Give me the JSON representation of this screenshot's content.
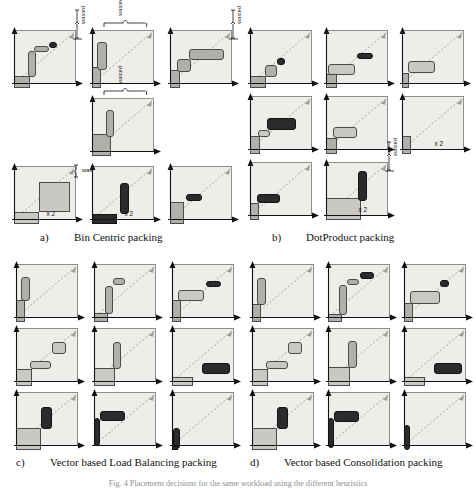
{
  "figure": {
    "caption": "Fig. 4 Placement decisions for the same workload using the different heuristics",
    "wasted_label": "wasted",
    "multiplier_label": "x 2"
  },
  "sections": [
    {
      "tag": "a)",
      "title": "Bin Centric packing"
    },
    {
      "tag": "b)",
      "title": "DotProduct packing"
    },
    {
      "tag": "c)",
      "title": "Vector based Load Balancing packing"
    },
    {
      "tag": "d)",
      "title": "Vector based Consolidation packing"
    }
  ],
  "colors": {
    "bin_fill": "#eeedea",
    "bin_border": "#8d8d8a",
    "item_light": "#c9c8c4",
    "item_mid": "#b0afab",
    "item_dark": "#2b2b2b",
    "item_pale": "#d8d7d3",
    "diagonal": "#9a9a97",
    "axis": "#111111"
  },
  "chart_data": {
    "type": "diagram",
    "title": "Placement decisions for the same workload using the different heuristics",
    "panels": [
      {
        "tag": "a)",
        "title": "Bin Centric packing",
        "bins": [
          {
            "row": 0,
            "col": 0,
            "wasted_brace": "vertical-right",
            "items": [
              {
                "x": 0.0,
                "y": 0.0,
                "w": 0.26,
                "h": 0.22,
                "shade": "mid",
                "square": true
              },
              {
                "x": 0.22,
                "y": 0.2,
                "w": 0.14,
                "h": 0.48,
                "shade": "mid"
              },
              {
                "x": 0.33,
                "y": 0.66,
                "w": 0.24,
                "h": 0.12,
                "shade": "mid"
              },
              {
                "x": 0.57,
                "y": 0.74,
                "w": 0.12,
                "h": 0.12,
                "shade": "dark"
              }
            ]
          },
          {
            "row": 0,
            "col": 1,
            "wasted_brace": "horizontal-top",
            "items": [
              {
                "x": 0.0,
                "y": 0.0,
                "w": 0.14,
                "h": 0.38,
                "shade": "mid",
                "square": true
              },
              {
                "x": 0.08,
                "y": 0.33,
                "w": 0.16,
                "h": 0.52,
                "shade": "mid"
              }
            ]
          },
          {
            "row": 0,
            "col": 2,
            "wasted_brace": "vertical-right",
            "items": [
              {
                "x": 0.0,
                "y": 0.0,
                "w": 0.16,
                "h": 0.34,
                "shade": "mid",
                "square": true
              },
              {
                "x": 0.12,
                "y": 0.3,
                "w": 0.22,
                "h": 0.24,
                "shade": "mid"
              },
              {
                "x": 0.31,
                "y": 0.52,
                "w": 0.56,
                "h": 0.2,
                "shade": "mid"
              }
            ]
          },
          {
            "row": 1,
            "col": 1,
            "wasted_brace": "horizontal-top",
            "items": [
              {
                "x": 0.0,
                "y": 0.0,
                "w": 0.3,
                "h": 0.4,
                "shade": "mid",
                "square": true
              },
              {
                "x": 0.22,
                "y": 0.36,
                "w": 0.14,
                "h": 0.5,
                "shade": "mid"
              }
            ]
          },
          {
            "row": 2,
            "col": 0,
            "wasted_brace": "vertical-right-small",
            "wasted_text": true,
            "multiplier": "x 2",
            "items": [
              {
                "x": 0.0,
                "y": 0.0,
                "w": 0.4,
                "h": 0.22,
                "shade": "light",
                "square": true
              },
              {
                "x": 0.4,
                "y": 0.22,
                "w": 0.5,
                "h": 0.56,
                "shade": "light",
                "square": true
              }
            ]
          },
          {
            "row": 2,
            "col": 1,
            "multiplier": "x 2",
            "items": [
              {
                "x": 0.0,
                "y": 0.0,
                "w": 0.4,
                "h": 0.18,
                "shade": "dark",
                "square": true
              },
              {
                "x": 0.45,
                "y": 0.18,
                "w": 0.14,
                "h": 0.58,
                "shade": "dark"
              }
            ]
          },
          {
            "row": 2,
            "col": 2,
            "items": [
              {
                "x": 0.0,
                "y": 0.0,
                "w": 0.22,
                "h": 0.4,
                "shade": "mid",
                "square": true
              },
              {
                "x": 0.26,
                "y": 0.42,
                "w": 0.26,
                "h": 0.13,
                "shade": "dark"
              }
            ]
          }
        ]
      },
      {
        "tag": "b)",
        "title": "DotProduct packing",
        "bins": [
          {
            "row": 0,
            "col": 0,
            "items": [
              {
                "x": 0.0,
                "y": 0.0,
                "w": 0.26,
                "h": 0.22,
                "shade": "mid",
                "square": true
              },
              {
                "x": 0.24,
                "y": 0.21,
                "w": 0.2,
                "h": 0.22,
                "shade": "mid"
              },
              {
                "x": 0.44,
                "y": 0.42,
                "w": 0.12,
                "h": 0.13,
                "shade": "dark"
              }
            ]
          },
          {
            "row": 0,
            "col": 1,
            "items": [
              {
                "x": 0.0,
                "y": 0.0,
                "w": 0.18,
                "h": 0.26,
                "shade": "mid",
                "square": true
              },
              {
                "x": 0.03,
                "y": 0.25,
                "w": 0.44,
                "h": 0.2,
                "shade": "light"
              },
              {
                "x": 0.5,
                "y": 0.53,
                "w": 0.26,
                "h": 0.11,
                "shade": "dark"
              }
            ]
          },
          {
            "row": 0,
            "col": 2,
            "items": [
              {
                "x": 0.0,
                "y": 0.0,
                "w": 0.12,
                "h": 0.28,
                "shade": "mid",
                "square": true
              },
              {
                "x": 0.1,
                "y": 0.28,
                "w": 0.44,
                "h": 0.22,
                "shade": "light"
              }
            ]
          },
          {
            "row": 1,
            "col": 0,
            "items": [
              {
                "x": 0.0,
                "y": 0.0,
                "w": 0.16,
                "h": 0.34,
                "shade": "mid",
                "square": true
              },
              {
                "x": 0.13,
                "y": 0.32,
                "w": 0.2,
                "h": 0.13,
                "shade": "light"
              },
              {
                "x": 0.28,
                "y": 0.44,
                "w": 0.46,
                "h": 0.22,
                "shade": "dark"
              }
            ]
          },
          {
            "row": 1,
            "col": 1,
            "items": [
              {
                "x": 0.0,
                "y": 0.0,
                "w": 0.18,
                "h": 0.3,
                "shade": "mid",
                "square": true
              },
              {
                "x": 0.12,
                "y": 0.3,
                "w": 0.38,
                "h": 0.2,
                "shade": "light"
              }
            ]
          },
          {
            "row": 1,
            "col": 2,
            "multiplier": "x 2",
            "items": [
              {
                "x": 0.0,
                "y": 0.0,
                "w": 0.14,
                "h": 0.34,
                "shade": "mid",
                "square": true
              }
            ]
          },
          {
            "row": 2,
            "col": 0,
            "items": [
              {
                "x": 0.0,
                "y": 0.0,
                "w": 0.14,
                "h": 0.32,
                "shade": "mid",
                "square": true
              },
              {
                "x": 0.12,
                "y": 0.32,
                "w": 0.36,
                "h": 0.17,
                "shade": "dark"
              }
            ]
          },
          {
            "row": 2,
            "col": 1,
            "wasted_brace": "vertical-right",
            "multiplier": "x 2",
            "items": [
              {
                "x": 0.0,
                "y": 0.0,
                "w": 0.56,
                "h": 0.4,
                "shade": "light",
                "square": true
              },
              {
                "x": 0.52,
                "y": 0.36,
                "w": 0.14,
                "h": 0.55,
                "shade": "dark"
              }
            ]
          }
        ]
      },
      {
        "tag": "c)",
        "title": "Vector based Load Balancing packing",
        "bins": [
          {
            "row": 0,
            "col": 0,
            "items": [
              {
                "x": 0.0,
                "y": 0.0,
                "w": 0.14,
                "h": 0.4,
                "shade": "mid",
                "square": true
              },
              {
                "x": 0.08,
                "y": 0.38,
                "w": 0.14,
                "h": 0.46,
                "shade": "mid"
              }
            ]
          },
          {
            "row": 0,
            "col": 1,
            "items": [
              {
                "x": 0.0,
                "y": 0.0,
                "w": 0.22,
                "h": 0.16,
                "shade": "mid",
                "square": true
              },
              {
                "x": 0.17,
                "y": 0.14,
                "w": 0.14,
                "h": 0.52,
                "shade": "mid"
              },
              {
                "x": 0.3,
                "y": 0.68,
                "w": 0.2,
                "h": 0.13,
                "shade": "mid"
              }
            ]
          },
          {
            "row": 0,
            "col": 2,
            "items": [
              {
                "x": 0.0,
                "y": 0.0,
                "w": 0.14,
                "h": 0.4,
                "shade": "mid",
                "square": true
              },
              {
                "x": 0.1,
                "y": 0.38,
                "w": 0.42,
                "h": 0.22,
                "shade": "light"
              },
              {
                "x": 0.55,
                "y": 0.64,
                "w": 0.24,
                "h": 0.12,
                "shade": "dark"
              }
            ]
          },
          {
            "row": 1,
            "col": 0,
            "items": [
              {
                "x": 0.0,
                "y": 0.0,
                "w": 0.26,
                "h": 0.32,
                "shade": "light",
                "square": true
              },
              {
                "x": 0.22,
                "y": 0.31,
                "w": 0.34,
                "h": 0.16,
                "shade": "light"
              },
              {
                "x": 0.58,
                "y": 0.6,
                "w": 0.22,
                "h": 0.22,
                "shade": "light"
              }
            ]
          },
          {
            "row": 1,
            "col": 1,
            "items": [
              {
                "x": 0.0,
                "y": 0.0,
                "w": 0.34,
                "h": 0.34,
                "shade": "light",
                "square": true
              },
              {
                "x": 0.3,
                "y": 0.32,
                "w": 0.14,
                "h": 0.5,
                "shade": "mid"
              }
            ]
          },
          {
            "row": 1,
            "col": 2,
            "items": [
              {
                "x": 0.0,
                "y": 0.0,
                "w": 0.34,
                "h": 0.16,
                "shade": "light",
                "square": true
              },
              {
                "x": 0.48,
                "y": 0.22,
                "w": 0.46,
                "h": 0.2,
                "shade": "dark"
              }
            ]
          },
          {
            "row": 2,
            "col": 0,
            "items": [
              {
                "x": 0.0,
                "y": 0.0,
                "w": 0.4,
                "h": 0.4,
                "shade": "light",
                "square": true
              },
              {
                "x": 0.4,
                "y": 0.38,
                "w": 0.18,
                "h": 0.42,
                "shade": "dark"
              }
            ]
          },
          {
            "row": 2,
            "col": 1,
            "items": [
              {
                "x": 0.0,
                "y": 0.08,
                "w": 0.1,
                "h": 0.52,
                "shade": "dark"
              },
              {
                "x": 0.1,
                "y": 0.54,
                "w": 0.4,
                "h": 0.18,
                "shade": "dark"
              }
            ]
          },
          {
            "row": 2,
            "col": 2,
            "items": [
              {
                "x": 0.02,
                "y": 0.02,
                "w": 0.11,
                "h": 0.38,
                "shade": "dark"
              },
              {
                "x": 0.0,
                "y": 0.0,
                "w": 0.09,
                "h": 0.07,
                "shade": "dark",
                "square": true
              }
            ]
          }
        ]
      },
      {
        "tag": "d)",
        "title": "Vector based Consolidation packing",
        "bins": [
          {
            "row": 0,
            "col": 0,
            "items": [
              {
                "x": 0.0,
                "y": 0.0,
                "w": 0.14,
                "h": 0.34,
                "shade": "mid",
                "square": true
              },
              {
                "x": 0.08,
                "y": 0.32,
                "w": 0.14,
                "h": 0.5,
                "shade": "mid"
              }
            ]
          },
          {
            "row": 0,
            "col": 1,
            "items": [
              {
                "x": 0.0,
                "y": 0.0,
                "w": 0.22,
                "h": 0.14,
                "shade": "mid",
                "square": true
              },
              {
                "x": 0.17,
                "y": 0.13,
                "w": 0.14,
                "h": 0.56,
                "shade": "mid"
              },
              {
                "x": 0.3,
                "y": 0.68,
                "w": 0.2,
                "h": 0.12,
                "shade": "mid"
              },
              {
                "x": 0.52,
                "y": 0.8,
                "w": 0.22,
                "h": 0.12,
                "shade": "dark"
              }
            ]
          },
          {
            "row": 0,
            "col": 2,
            "items": [
              {
                "x": 0.0,
                "y": 0.0,
                "w": 0.14,
                "h": 0.36,
                "shade": "mid",
                "square": true
              },
              {
                "x": 0.1,
                "y": 0.34,
                "w": 0.48,
                "h": 0.24,
                "shade": "light"
              },
              {
                "x": 0.58,
                "y": 0.64,
                "w": 0.14,
                "h": 0.14,
                "shade": "dark"
              }
            ]
          },
          {
            "row": 1,
            "col": 0,
            "items": [
              {
                "x": 0.0,
                "y": 0.0,
                "w": 0.26,
                "h": 0.32,
                "shade": "light",
                "square": true
              },
              {
                "x": 0.22,
                "y": 0.31,
                "w": 0.36,
                "h": 0.16,
                "shade": "light"
              },
              {
                "x": 0.58,
                "y": 0.6,
                "w": 0.22,
                "h": 0.22,
                "shade": "light"
              }
            ]
          },
          {
            "row": 1,
            "col": 1,
            "items": [
              {
                "x": 0.0,
                "y": 0.0,
                "w": 0.36,
                "h": 0.36,
                "shade": "light",
                "square": true
              },
              {
                "x": 0.32,
                "y": 0.34,
                "w": 0.14,
                "h": 0.5,
                "shade": "mid"
              }
            ]
          },
          {
            "row": 1,
            "col": 2,
            "items": [
              {
                "x": 0.0,
                "y": 0.0,
                "w": 0.34,
                "h": 0.16,
                "shade": "light",
                "square": true
              },
              {
                "x": 0.48,
                "y": 0.22,
                "w": 0.46,
                "h": 0.2,
                "shade": "dark"
              }
            ]
          },
          {
            "row": 2,
            "col": 0,
            "items": [
              {
                "x": 0.0,
                "y": 0.0,
                "w": 0.4,
                "h": 0.4,
                "shade": "light",
                "square": true
              },
              {
                "x": 0.4,
                "y": 0.38,
                "w": 0.18,
                "h": 0.42,
                "shade": "dark"
              }
            ]
          },
          {
            "row": 2,
            "col": 1,
            "items": [
              {
                "x": 0.0,
                "y": 0.04,
                "w": 0.1,
                "h": 0.56,
                "shade": "dark"
              },
              {
                "x": 0.1,
                "y": 0.52,
                "w": 0.4,
                "h": 0.2,
                "shade": "dark"
              }
            ]
          },
          {
            "row": 2,
            "col": 2,
            "items": [
              {
                "x": 0.0,
                "y": 0.0,
                "w": 0.1,
                "h": 0.46,
                "shade": "dark"
              }
            ]
          }
        ]
      }
    ]
  }
}
